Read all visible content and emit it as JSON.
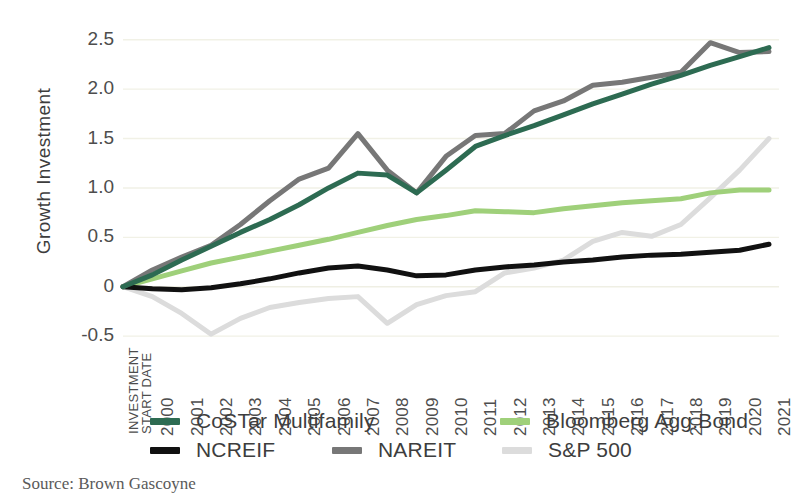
{
  "axis": {
    "y_title": "Growth Investment",
    "y_ticks": [
      "2.5",
      "2.0",
      "1.5",
      "1.0",
      "0.5",
      "0",
      "-0.5"
    ],
    "x_first_label_lines": [
      "INVESTMENT",
      "START DATE"
    ]
  },
  "legend": {
    "row1": [
      {
        "label": "CoSTar Multifamily",
        "color": "#2d6b52",
        "key": "costar"
      },
      {
        "label": "Bloomberg Agg.Bond",
        "color": "#9fd07a",
        "key": "bloomberg"
      }
    ],
    "row2": [
      {
        "label": "NCREIF",
        "color": "#111111",
        "key": "ncreif"
      },
      {
        "label": "NAREIT",
        "color": "#777777",
        "key": "nareit"
      },
      {
        "label": "S&P 500",
        "color": "#dcdcdc",
        "key": "sp500"
      }
    ]
  },
  "source": "Source: Brown Gascoyne",
  "chart_data": {
    "type": "line",
    "title": "",
    "xlabel": "INVESTMENT START DATE",
    "ylabel": "Growth Investment",
    "grid": true,
    "legend_position": "bottom",
    "ylim": [
      -0.62,
      2.72
    ],
    "yticks": [
      2.5,
      2.0,
      1.5,
      1.0,
      0.5,
      0,
      -0.5
    ],
    "x": [
      "INVESTMENT START DATE",
      "2000",
      "2001",
      "2002",
      "2003",
      "2004",
      "2005",
      "2006",
      "2007",
      "2008",
      "2009",
      "2010",
      "2011",
      "2012",
      "2013",
      "2014",
      "2015",
      "2016",
      "2017",
      "2018",
      "2019",
      "2020",
      "2021"
    ],
    "categories": [
      "1999",
      "2000",
      "2001",
      "2002",
      "2003",
      "2004",
      "2005",
      "2006",
      "2007",
      "2008",
      "2009",
      "2010",
      "2011",
      "2012",
      "2013",
      "2014",
      "2015",
      "2016",
      "2017",
      "2018",
      "2019",
      "2020",
      "2021"
    ],
    "series": [
      {
        "name": "CoSTar Multifamily",
        "color": "#2d6b52",
        "values": [
          0,
          0.12,
          0.27,
          0.41,
          0.55,
          0.68,
          0.83,
          1.0,
          1.15,
          1.13,
          0.95,
          1.18,
          1.42,
          1.53,
          1.63,
          1.74,
          1.85,
          1.95,
          2.05,
          2.14,
          2.24,
          2.33,
          2.42
        ]
      },
      {
        "name": "Bloomberg Agg.Bond",
        "color": "#9fd07a",
        "values": [
          0,
          0.08,
          0.16,
          0.24,
          0.3,
          0.36,
          0.42,
          0.48,
          0.55,
          0.62,
          0.68,
          0.72,
          0.77,
          0.76,
          0.75,
          0.79,
          0.82,
          0.85,
          0.87,
          0.89,
          0.95,
          0.98,
          0.98
        ]
      },
      {
        "name": "NCREIF",
        "color": "#111111",
        "values": [
          0,
          -0.02,
          -0.03,
          -0.01,
          0.03,
          0.08,
          0.14,
          0.19,
          0.21,
          0.17,
          0.11,
          0.12,
          0.17,
          0.2,
          0.22,
          0.25,
          0.27,
          0.3,
          0.32,
          0.33,
          0.35,
          0.37,
          0.43
        ]
      },
      {
        "name": "NAREIT",
        "color": "#777777",
        "values": [
          0,
          0.17,
          0.3,
          0.42,
          0.63,
          0.87,
          1.09,
          1.2,
          1.55,
          1.18,
          0.95,
          1.32,
          1.53,
          1.55,
          1.78,
          1.88,
          2.04,
          2.07,
          2.12,
          2.17,
          2.47,
          2.37,
          2.38
        ]
      },
      {
        "name": "S&P 500",
        "color": "#dcdcdc",
        "values": [
          0,
          -0.1,
          -0.27,
          -0.48,
          -0.32,
          -0.21,
          -0.16,
          -0.12,
          -0.1,
          -0.37,
          -0.18,
          -0.09,
          -0.05,
          0.14,
          0.19,
          0.27,
          0.46,
          0.55,
          0.51,
          0.63,
          0.9,
          1.18,
          1.5
        ]
      }
    ]
  }
}
